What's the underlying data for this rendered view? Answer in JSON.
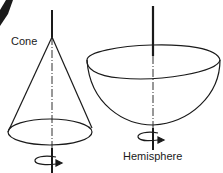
{
  "diagram": {
    "shapes": [
      {
        "name": "Cone",
        "label": "Cone"
      },
      {
        "name": "Hemisphere",
        "label": "Hemisphere"
      }
    ],
    "colors": {
      "stroke": "#1a1a1a",
      "background": "#ffffff"
    }
  }
}
